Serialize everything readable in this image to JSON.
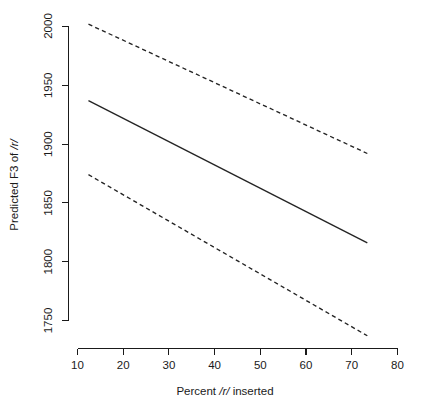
{
  "chart_data": {
    "type": "line",
    "title": "",
    "xlabel": "Percent /r/ inserted",
    "ylabel": "Predicted F3 of /r/",
    "xlim": [
      7,
      83
    ],
    "ylim": [
      1735,
      2010
    ],
    "grid": false,
    "legend": null,
    "xticks": [
      10,
      20,
      30,
      40,
      50,
      60,
      70,
      80
    ],
    "xtick_labels": [
      "10",
      "20",
      "30",
      "40",
      "50",
      "60",
      "70",
      "80"
    ],
    "yticks": [
      1750,
      1800,
      1850,
      1900,
      1950,
      2000
    ],
    "ytick_labels": [
      "1750",
      "1800",
      "1850",
      "1900",
      "1950",
      "2000"
    ],
    "series": [
      {
        "name": "upper confidence bound",
        "style": "dashed",
        "x": [
          12.4,
          73.4
        ],
        "values": [
          2002,
          1892
        ]
      },
      {
        "name": "predicted fit",
        "style": "solid",
        "x": [
          12.4,
          73.4
        ],
        "values": [
          1937,
          1816
        ]
      },
      {
        "name": "lower confidence bound",
        "style": "dashed",
        "x": [
          12.4,
          73.4
        ],
        "values": [
          1874,
          1737
        ]
      }
    ],
    "annotations": []
  },
  "axis_labels": {
    "y_prefix": "Predicted F3 of ",
    "y_italic": "/r/",
    "x_prefix": "Percent ",
    "x_italic": "/r/",
    "x_suffix": " inserted"
  },
  "colors": {
    "line": "#242424",
    "axis": "#1a1a1a",
    "background": "#ffffff"
  }
}
